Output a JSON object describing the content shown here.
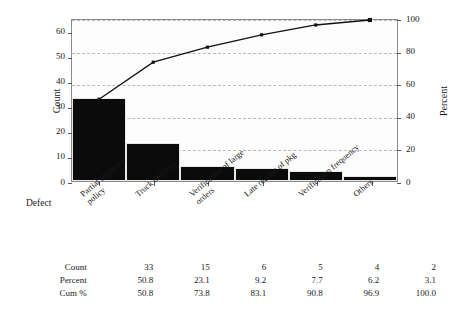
{
  "chart_data": {
    "type": "bar",
    "title": "",
    "subtitle": "",
    "xlabel": "Defect",
    "ylabel": "Count",
    "y2label": "Percent",
    "grid": true,
    "legend": "none",
    "categories": [
      "Partial shipment\npolicy",
      "Truck delivery",
      "Verification of large\norders",
      "Late receipt of pkg",
      "Verification frequency",
      "Others"
    ],
    "values": [
      33,
      15,
      6,
      5,
      4,
      2
    ],
    "ylim": [
      0,
      65
    ],
    "y2lim": [
      0,
      100
    ],
    "yticks": [
      0,
      10,
      20,
      30,
      40,
      50,
      60
    ],
    "y2ticks": [
      0,
      20,
      40,
      60,
      80,
      100
    ],
    "series": [
      {
        "name": "Count",
        "values": [
          33,
          15,
          6,
          5,
          4,
          2
        ]
      },
      {
        "name": "Percent",
        "values": [
          50.8,
          23.1,
          9.2,
          7.7,
          6.2,
          3.1
        ]
      },
      {
        "name": "Cum %",
        "values": [
          50.8,
          73.8,
          83.1,
          90.8,
          96.9,
          100.0
        ]
      }
    ],
    "bar_color": "#0b0b0b",
    "line_color": "#111111"
  },
  "table": {
    "rows": [
      {
        "label": "Count",
        "values": [
          "33",
          "15",
          "6",
          "5",
          "4",
          "2"
        ]
      },
      {
        "label": "Percent",
        "values": [
          "50.8",
          "23.1",
          "9.2",
          "7.7",
          "6.2",
          "3.1"
        ]
      },
      {
        "label": "Cum %",
        "values": [
          "50.8",
          "73.8",
          "83.1",
          "90.8",
          "96.9",
          "100.0"
        ]
      }
    ]
  },
  "axes": {
    "left_title": "Count",
    "right_title": "Percent",
    "x_title": "Defect",
    "left_ticks": [
      "0",
      "10",
      "20",
      "30",
      "40",
      "50",
      "60"
    ],
    "right_ticks": [
      "0",
      "20",
      "40",
      "60",
      "80",
      "100"
    ]
  }
}
